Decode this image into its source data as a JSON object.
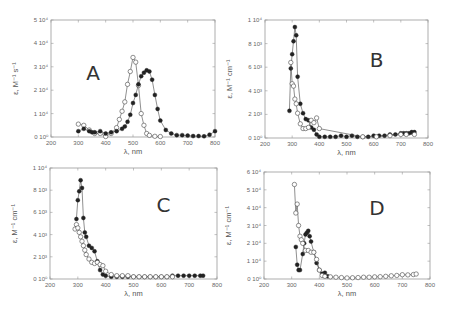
{
  "chart_data": [
    {
      "panel": "A",
      "type": "scatter",
      "title": "",
      "panel_label": "A",
      "xlabel": "λ, nm",
      "ylabel": "ε, M⁻¹ s⁻¹",
      "xlim": [
        200,
        800
      ],
      "ylim": [
        0,
        50000
      ],
      "xticks": [
        200,
        300,
        400,
        500,
        600,
        700,
        800
      ],
      "yticks": [
        0,
        10000,
        20000,
        30000,
        40000,
        50000
      ],
      "ytick_labels": [
        "0 10⁰",
        "1 10⁴",
        "2 10⁴",
        "3 10⁴",
        "4 10⁴",
        "5 10⁴"
      ],
      "grid": false,
      "box": {
        "left": 51,
        "top": 20,
        "right": 215,
        "bottom": 137
      },
      "series": [
        {
          "name": "open",
          "marker": "open-circle",
          "x": [
            300,
            320,
            340,
            360,
            380,
            400,
            420,
            440,
            450,
            460,
            470,
            480,
            490,
            500,
            510,
            520,
            530,
            540,
            550,
            560,
            580,
            600
          ],
          "y": [
            5500,
            5000,
            3000,
            1500,
            1500,
            200,
            1500,
            4000,
            7500,
            11000,
            15000,
            22500,
            28000,
            34000,
            32000,
            22000,
            10000,
            5000,
            1500,
            700,
            300,
            200
          ]
        },
        {
          "name": "filled",
          "marker": "filled-circle",
          "x": [
            300,
            320,
            340,
            350,
            360,
            380,
            400,
            420,
            440,
            460,
            470,
            480,
            490,
            500,
            510,
            520,
            530,
            540,
            550,
            560,
            570,
            580,
            590,
            600,
            620,
            640,
            660,
            680,
            700,
            720,
            740,
            760,
            780,
            800
          ],
          "y": [
            2500,
            3500,
            2500,
            2000,
            2000,
            2500,
            1500,
            2000,
            2500,
            3500,
            4500,
            6500,
            9500,
            14500,
            18000,
            22500,
            26000,
            27500,
            28500,
            28000,
            24500,
            18000,
            12000,
            7000,
            3000,
            1500,
            800,
            800,
            600,
            400,
            400,
            300,
            1000,
            2500
          ]
        }
      ]
    },
    {
      "panel": "B",
      "type": "scatter",
      "title": "",
      "panel_label": "B",
      "xlabel": "λ, nm",
      "ylabel": "ε, M⁻¹ cm⁻¹",
      "xlim": [
        200,
        800
      ],
      "ylim": [
        0,
        10000
      ],
      "xticks": [
        200,
        300,
        400,
        500,
        600,
        700,
        800
      ],
      "yticks": [
        0,
        2000,
        4000,
        6000,
        8000,
        10000
      ],
      "ytick_labels": [
        "0 10⁰",
        "2 10³",
        "4 10³",
        "6 10³",
        "8 10³",
        "1 10⁴"
      ],
      "grid": false,
      "box": {
        "left": 265,
        "top": 20,
        "right": 428,
        "bottom": 138
      },
      "series": [
        {
          "name": "filled",
          "marker": "filled-circle",
          "x": [
            290,
            295,
            300,
            305,
            310,
            315,
            320,
            330,
            340,
            350,
            360,
            370,
            380,
            390,
            400,
            420,
            440,
            460,
            480,
            500,
            520,
            540,
            560,
            580,
            600,
            620,
            640,
            660,
            680,
            700,
            710,
            720,
            730,
            740,
            750
          ],
          "y": [
            2300,
            5900,
            7100,
            8200,
            9400,
            8700,
            5200,
            2900,
            2100,
            1600,
            1500,
            900,
            700,
            300,
            100,
            100,
            100,
            100,
            200,
            100,
            200,
            100,
            100,
            100,
            200,
            200,
            200,
            300,
            300,
            400,
            400,
            400,
            400,
            500,
            500
          ]
        },
        {
          "name": "open",
          "marker": "open-circle",
          "x": [
            295,
            300,
            305,
            310,
            315,
            320,
            330,
            340,
            350,
            360,
            370,
            380,
            390,
            400,
            560,
            610,
            660,
            700,
            720,
            750
          ],
          "y": [
            6400,
            4600,
            4400,
            3300,
            2900,
            2100,
            1200,
            800,
            800,
            900,
            1500,
            1300,
            1700,
            800,
            100,
            100,
            200,
            300,
            300,
            300
          ]
        }
      ]
    },
    {
      "panel": "C",
      "type": "scatter",
      "title": "",
      "panel_label": "C",
      "xlabel": "λ, nm",
      "ylabel": "ε, M⁻¹ cm⁻¹",
      "xlim": [
        200,
        800
      ],
      "ylim": [
        0,
        10000
      ],
      "xticks": [
        200,
        300,
        400,
        500,
        600,
        700,
        800
      ],
      "yticks": [
        0,
        2000,
        4000,
        6000,
        8000,
        10000
      ],
      "ytick_labels": [
        "0 10⁰",
        "2 10³",
        "4 10³",
        "6 10³",
        "8 10³",
        "1 10⁴"
      ],
      "grid": false,
      "box": {
        "left": 50,
        "top": 168,
        "right": 217,
        "bottom": 279
      },
      "series": [
        {
          "name": "filled",
          "marker": "filled-circle",
          "x": [
            295,
            300,
            305,
            310,
            315,
            320,
            325,
            330,
            340,
            350,
            360,
            370,
            380,
            390,
            400,
            420,
            440,
            460,
            480,
            500,
            520,
            540,
            560,
            580,
            600,
            620,
            640,
            660,
            680,
            700,
            720,
            740,
            750
          ],
          "y": [
            5400,
            7100,
            7900,
            8900,
            8200,
            5500,
            4200,
            3800,
            3000,
            2800,
            2500,
            1600,
            800,
            400,
            300,
            200,
            200,
            200,
            200,
            200,
            200,
            200,
            200,
            200,
            200,
            200,
            300,
            300,
            300,
            300,
            300,
            300,
            300
          ]
        },
        {
          "name": "open",
          "marker": "open-circle",
          "x": [
            290,
            295,
            300,
            305,
            310,
            315,
            320,
            325,
            330,
            340,
            350,
            360,
            370,
            380,
            390,
            400,
            420,
            440,
            460,
            480,
            500,
            520,
            540,
            560,
            580,
            600,
            620,
            640
          ],
          "y": [
            4500,
            4900,
            4600,
            4200,
            3800,
            3400,
            3000,
            2600,
            2200,
            1800,
            1500,
            1400,
            1500,
            1300,
            1200,
            700,
            400,
            300,
            300,
            300,
            200,
            200,
            200,
            200,
            200,
            200,
            200,
            200
          ]
        }
      ]
    },
    {
      "panel": "D",
      "type": "scatter",
      "title": "",
      "panel_label": "D",
      "xlabel": "λ, nm",
      "ylabel": "ε, M⁻¹ cm⁻¹",
      "xlim": [
        200,
        800
      ],
      "ylim": [
        0,
        60000
      ],
      "xticks": [
        200,
        300,
        400,
        500,
        600,
        700,
        800
      ],
      "yticks": [
        0,
        10000,
        20000,
        30000,
        40000,
        50000,
        60000
      ],
      "ytick_labels": [
        "0 10⁰",
        "1 10⁴",
        "2 10⁴",
        "3 10⁴",
        "4 10⁴",
        "5 10⁴",
        "6 10⁴"
      ],
      "grid": false,
      "box": {
        "left": 264,
        "top": 172,
        "right": 430,
        "bottom": 279
      },
      "series": [
        {
          "name": "filled",
          "marker": "filled-circle",
          "x": [
            315,
            320,
            325,
            330,
            340,
            345,
            350,
            355,
            360,
            365,
            370,
            380,
            390,
            400,
            410,
            420,
            430
          ],
          "y": [
            18000,
            8000,
            5000,
            5000,
            14000,
            20000,
            25000,
            26000,
            27000,
            24000,
            21000,
            15000,
            9000,
            5000,
            3000,
            3500,
            1500
          ]
        },
        {
          "name": "open",
          "marker": "open-circle",
          "x": [
            310,
            315,
            320,
            325,
            330,
            335,
            340,
            350,
            360,
            370,
            380,
            390,
            400,
            410,
            420,
            440,
            460,
            480,
            500,
            520,
            540,
            560,
            580,
            600,
            620,
            640,
            660,
            680,
            700,
            720,
            740,
            750
          ],
          "y": [
            53000,
            37000,
            42000,
            30000,
            24000,
            22000,
            20000,
            16000,
            16000,
            15000,
            15000,
            11000,
            5000,
            2000,
            1500,
            1200,
            1000,
            800,
            600,
            700,
            800,
            1000,
            1000,
            1200,
            1300,
            1500,
            1800,
            2000,
            2400,
            2300,
            2500,
            2800
          ]
        }
      ]
    }
  ]
}
